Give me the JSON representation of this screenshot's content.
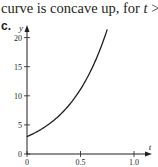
{
  "caption": {
    "prefix": "curve is concave up, for ",
    "variable": "t",
    "suffix": " > 0."
  },
  "part_label": "c.",
  "chart_data": {
    "type": "line",
    "title": "",
    "xlabel": "t",
    "ylabel": "y",
    "xlim": [
      0,
      1.1
    ],
    "ylim": [
      0,
      22
    ],
    "x_ticks": [
      0,
      0.5,
      1.0
    ],
    "x_tick_labels": [
      "0",
      "0.5",
      "1.0"
    ],
    "y_ticks": [
      0,
      5,
      10,
      15,
      20
    ],
    "y_tick_labels": [
      "0",
      "5",
      "10",
      "15",
      "20"
    ],
    "grid": false,
    "series": [
      {
        "name": "y = 3e^(2.6t)",
        "x": [
          0,
          0.1,
          0.2,
          0.3,
          0.4,
          0.5,
          0.6,
          0.7,
          0.75
        ],
        "y": [
          3.0,
          3.9,
          5.0,
          6.5,
          8.5,
          11.0,
          14.3,
          18.6,
          21.4
        ]
      }
    ],
    "colors": {
      "axis": "#231f20",
      "curve": "#231f20"
    }
  }
}
